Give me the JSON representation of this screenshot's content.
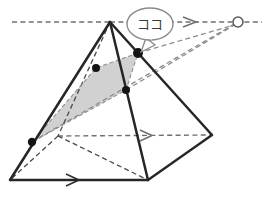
{
  "figure": {
    "type": "geometry-perspective-diagram",
    "callout": {
      "text": "ココ",
      "meaning": "here",
      "target_point_label": "P2",
      "shape": "speech-bubble-ellipse"
    },
    "colors": {
      "stroke_solid": "#262626",
      "stroke_dashed": "#6f6f6f",
      "shade_fill": "#cfcfcf",
      "dot_fill": "#141414",
      "vanishing_point_fill": "#ffffff",
      "bubble_stroke": "#8a8a8a",
      "background": "#ffffff"
    },
    "canvas": {
      "width": 267,
      "height": 202
    },
    "points": {
      "apex": {
        "x": 110,
        "y": 22,
        "name": "pyramid-apex"
      },
      "base_left": {
        "x": 10,
        "y": 180,
        "name": "base-left-corner"
      },
      "base_front": {
        "x": 148,
        "y": 180,
        "name": "base-front-corner"
      },
      "base_right": {
        "x": 212,
        "y": 135,
        "name": "base-right-corner"
      },
      "base_back": {
        "x": 58,
        "y": 136,
        "name": "base-back-corner-hidden"
      },
      "vanishing_point": {
        "x": 238,
        "y": 22,
        "name": "vanishing-point"
      }
    },
    "section_quad": {
      "label": "shaded-cross-section",
      "vertices": [
        {
          "x": 32,
          "y": 142,
          "label": "P0"
        },
        {
          "x": 96,
          "y": 68,
          "label": "P1"
        },
        {
          "x": 138,
          "y": 53,
          "label": "P2"
        },
        {
          "x": 126,
          "y": 90,
          "label": "P3"
        }
      ]
    },
    "dots": [
      {
        "x": 32,
        "y": 142,
        "r": 4.2,
        "label": "P0"
      },
      {
        "x": 96,
        "y": 68,
        "r": 4.0,
        "label": "P1"
      },
      {
        "x": 138,
        "y": 53,
        "r": 5.0,
        "label": "P2"
      },
      {
        "x": 126,
        "y": 90,
        "r": 4.0,
        "label": "P3"
      }
    ],
    "guides": [
      {
        "name": "horizon-dashed-left",
        "x1": 12,
        "y1": 22,
        "x2": 110,
        "y2": 22,
        "arrow": false
      },
      {
        "name": "horizon-dashed-right",
        "x1": 110,
        "y1": 22,
        "x2": 262,
        "y2": 22,
        "arrow": true,
        "arrow_at": 190
      },
      {
        "name": "mid-dashed-horizontal",
        "x1": 58,
        "y1": 136,
        "x2": 212,
        "y2": 135,
        "arrow": true,
        "arrow_at": 148
      },
      {
        "name": "base-front-arrow",
        "x1": 10,
        "y1": 180,
        "x2": 148,
        "y2": 180,
        "arrow": true,
        "arrow_at": 75
      }
    ],
    "convergence_lines": [
      {
        "name": "vp-ray-to-P0",
        "x1": 32,
        "y1": 142,
        "x2": 238,
        "y2": 22
      },
      {
        "name": "vp-ray-to-P2",
        "x1": 138,
        "y1": 53,
        "x2": 238,
        "y2": 22
      },
      {
        "name": "vp-ray-to-P3",
        "x1": 126,
        "y1": 90,
        "x2": 238,
        "y2": 22
      }
    ],
    "hidden_edges": [
      {
        "name": "apex-to-base-back",
        "x1": 110,
        "y1": 22,
        "x2": 58,
        "y2": 136
      },
      {
        "name": "base-back-to-base-left",
        "x1": 58,
        "y1": 136,
        "x2": 10,
        "y2": 180
      },
      {
        "name": "base-back-to-base-front",
        "x1": 58,
        "y1": 136,
        "x2": 148,
        "y2": 180
      }
    ],
    "solid_edges": [
      {
        "name": "apex-to-base-left",
        "x1": 110,
        "y1": 22,
        "x2": 10,
        "y2": 180
      },
      {
        "name": "apex-to-base-front",
        "x1": 110,
        "y1": 22,
        "x2": 148,
        "y2": 180
      },
      {
        "name": "apex-to-base-right",
        "x1": 110,
        "y1": 22,
        "x2": 212,
        "y2": 135
      },
      {
        "name": "base-left-to-front",
        "x1": 10,
        "y1": 180,
        "x2": 148,
        "y2": 180
      },
      {
        "name": "base-front-to-right",
        "x1": 148,
        "y1": 180,
        "x2": 212,
        "y2": 135
      }
    ]
  }
}
